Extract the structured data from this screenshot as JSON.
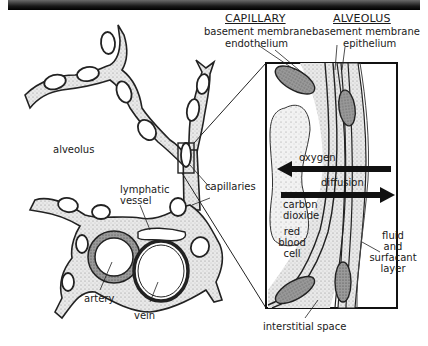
{
  "title_bar": {
    "style": "dark-gradient-band"
  },
  "headers": {
    "capillary": "CAPILLARY",
    "alveolus": "ALVEOLUS"
  },
  "labels": {
    "capillary_basement_membrane": "basement membrane",
    "endothelium": "endothelium",
    "alveolus_basement_membrane": "basement membrane",
    "epithelium": "epithelium",
    "alveolus": "alveolus",
    "capillaries": "capillaries",
    "lymphatic": "lymphatic",
    "vessel": "vessel",
    "artery": "artery",
    "vein": "vein",
    "oxygen": "oxygen",
    "diffusion": "diffusion",
    "carbon": "carbon",
    "dioxide": "dioxide",
    "red": "red",
    "blood": "blood",
    "cell": "cell",
    "fluid": "fluid",
    "and": "and",
    "surfacant": "surfacant",
    "layer": "layer",
    "interstitial_space": "interstitial space"
  },
  "arrows": [
    {
      "name": "oxygen-arrow",
      "direction": "left"
    },
    {
      "name": "carbon-dioxide-arrow",
      "direction": "right"
    }
  ],
  "colors": {
    "ink": "#1a1a1a",
    "stipple": "#d8d8d8",
    "cell_fill": "#8a8a8a",
    "background": "#ffffff"
  }
}
